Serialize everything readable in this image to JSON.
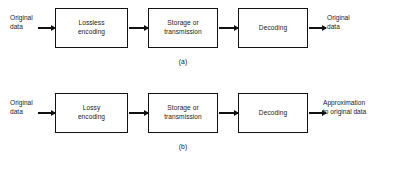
{
  "figure": {
    "background_color": "#ffffff",
    "line_color": "#111111",
    "text_color": "#1a1a1a"
  },
  "diagrams": [
    {
      "id": "a",
      "label": "(a)",
      "input_caption": "Original\ndata",
      "output_caption": "Original\ndata",
      "stages": [
        {
          "label": "Lossless\nencoding"
        },
        {
          "label": "Storage or\ntransmission"
        },
        {
          "label": "Decoding"
        }
      ],
      "arrows": [
        {
          "name": "input-arrow",
          "direction": "right"
        },
        {
          "name": "stage1-to-stage2-arrow",
          "direction": "right"
        },
        {
          "name": "stage2-to-stage3-arrow",
          "direction": "right"
        },
        {
          "name": "output-arrow",
          "direction": "right"
        }
      ]
    },
    {
      "id": "b",
      "label": "(b)",
      "input_caption": "Original\ndata",
      "output_caption": "Approximation\nto original data",
      "stages": [
        {
          "label": "Lossy\nencoding"
        },
        {
          "label": "Storage or\ntransmission"
        },
        {
          "label": "Decoding"
        }
      ],
      "arrows": [
        {
          "name": "input-arrow",
          "direction": "right"
        },
        {
          "name": "stage1-to-stage2-arrow",
          "direction": "right"
        },
        {
          "name": "stage2-to-stage3-arrow",
          "direction": "right"
        },
        {
          "name": "output-arrow",
          "direction": "right"
        }
      ]
    }
  ]
}
